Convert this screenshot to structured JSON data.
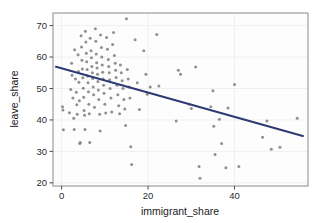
{
  "chart_data": {
    "type": "scatter",
    "title": "",
    "subtitle": "",
    "xlabel": "immigrant_share",
    "ylabel": "leave_share",
    "xlim": [
      -2,
      57
    ],
    "ylim": [
      19,
      74
    ],
    "xticks": [
      0,
      20,
      40
    ],
    "yticks": [
      20,
      30,
      40,
      50,
      60,
      70
    ],
    "xtick_labels": [
      "0",
      "20",
      "40"
    ],
    "ytick_labels": [
      "20",
      "30",
      "40",
      "50",
      "60",
      "70"
    ],
    "grid": true,
    "grid_axis": "both",
    "legend": "none",
    "point_color": "#7d7d7d",
    "point_opacity": 0.85,
    "point_size": 3.0,
    "fit_line_color": "#2f3a73",
    "fit_line_width": 2.0,
    "panel_background": "#fdfdfd",
    "panel_border_color": "#8a8a8a",
    "grid_color": "#f0f0f0",
    "series": [
      {
        "name": "fit_line",
        "type": "line",
        "x": [
          -1.5,
          56.0
        ],
        "y": [
          57.0,
          34.8
        ]
      }
    ],
    "points": [
      [
        0.2,
        44.2
      ],
      [
        0.3,
        43.2
      ],
      [
        0.4,
        36.9
      ],
      [
        1.8,
        42.3
      ],
      [
        2.1,
        49.7
      ],
      [
        2.3,
        58.0
      ],
      [
        2.4,
        54.2
      ],
      [
        2.6,
        47.0
      ],
      [
        2.8,
        40.5
      ],
      [
        2.9,
        37.0
      ],
      [
        3.0,
        62.3
      ],
      [
        3.2,
        53.0
      ],
      [
        3.4,
        48.8
      ],
      [
        3.5,
        44.8
      ],
      [
        3.6,
        41.8
      ],
      [
        3.8,
        60.7
      ],
      [
        3.9,
        55.4
      ],
      [
        4.0,
        52.0
      ],
      [
        4.1,
        46.1
      ],
      [
        4.2,
        32.5
      ],
      [
        4.3,
        32.8
      ],
      [
        4.5,
        66.8
      ],
      [
        4.6,
        63.2
      ],
      [
        4.7,
        59.0
      ],
      [
        4.8,
        56.2
      ],
      [
        4.9,
        53.4
      ],
      [
        5.0,
        50.1
      ],
      [
        5.1,
        47.2
      ],
      [
        5.2,
        43.0
      ],
      [
        5.3,
        41.5
      ],
      [
        5.4,
        37.0
      ],
      [
        5.5,
        68.2
      ],
      [
        5.6,
        64.8
      ],
      [
        5.7,
        61.2
      ],
      [
        5.8,
        58.5
      ],
      [
        5.9,
        56.0
      ],
      [
        6.0,
        54.0
      ],
      [
        6.1,
        51.8
      ],
      [
        6.2,
        49.0
      ],
      [
        6.3,
        45.0
      ],
      [
        6.4,
        42.0
      ],
      [
        6.5,
        32.8
      ],
      [
        6.6,
        66.0
      ],
      [
        6.8,
        62.0
      ],
      [
        6.9,
        59.8
      ],
      [
        7.0,
        57.0
      ],
      [
        7.1,
        55.0
      ],
      [
        7.2,
        53.2
      ],
      [
        7.3,
        50.5
      ],
      [
        7.4,
        48.0
      ],
      [
        7.6,
        44.0
      ],
      [
        7.8,
        69.0
      ],
      [
        7.9,
        65.0
      ],
      [
        8.0,
        61.0
      ],
      [
        8.1,
        58.2
      ],
      [
        8.2,
        56.5
      ],
      [
        8.3,
        54.5
      ],
      [
        8.4,
        52.2
      ],
      [
        8.5,
        49.5
      ],
      [
        8.6,
        46.5
      ],
      [
        8.8,
        41.8
      ],
      [
        8.9,
        36.5
      ],
      [
        9.0,
        67.0
      ],
      [
        9.2,
        63.0
      ],
      [
        9.3,
        60.0
      ],
      [
        9.4,
        57.5
      ],
      [
        9.5,
        55.2
      ],
      [
        9.6,
        53.0
      ],
      [
        9.7,
        51.0
      ],
      [
        9.8,
        48.5
      ],
      [
        10.0,
        45.0
      ],
      [
        10.2,
        42.2
      ],
      [
        10.4,
        66.2
      ],
      [
        10.6,
        62.5
      ],
      [
        10.8,
        59.2
      ],
      [
        10.9,
        57.0
      ],
      [
        11.0,
        55.0
      ],
      [
        11.1,
        52.8
      ],
      [
        11.2,
        50.0
      ],
      [
        11.4,
        47.0
      ],
      [
        11.6,
        42.5
      ],
      [
        11.8,
        64.0
      ],
      [
        12.0,
        67.8
      ],
      [
        12.2,
        60.5
      ],
      [
        12.4,
        58.0
      ],
      [
        12.5,
        55.8
      ],
      [
        12.6,
        53.5
      ],
      [
        12.8,
        51.0
      ],
      [
        13.0,
        48.0
      ],
      [
        13.2,
        44.5
      ],
      [
        13.4,
        42.0
      ],
      [
        13.6,
        57.5
      ],
      [
        13.8,
        55.0
      ],
      [
        14.0,
        52.5
      ],
      [
        14.2,
        50.0
      ],
      [
        14.4,
        46.5
      ],
      [
        14.6,
        43.5
      ],
      [
        14.8,
        38.2
      ],
      [
        15.0,
        72.2
      ],
      [
        15.2,
        56.0
      ],
      [
        15.4,
        53.0
      ],
      [
        15.6,
        50.5
      ],
      [
        15.8,
        47.0
      ],
      [
        16.0,
        31.5
      ],
      [
        16.2,
        25.8
      ],
      [
        17.0,
        65.5
      ],
      [
        17.5,
        51.8
      ],
      [
        18.0,
        43.3
      ],
      [
        19.0,
        62.0
      ],
      [
        19.5,
        54.5
      ],
      [
        19.8,
        48.2
      ],
      [
        20.5,
        50.5
      ],
      [
        22.0,
        67.2
      ],
      [
        22.5,
        50.8
      ],
      [
        26.5,
        39.7
      ],
      [
        27.0,
        55.8
      ],
      [
        27.5,
        54.5
      ],
      [
        29.5,
        45.0
      ],
      [
        30.0,
        43.6
      ],
      [
        31.0,
        56.8
      ],
      [
        31.8,
        25.2
      ],
      [
        32.0,
        21.5
      ],
      [
        34.5,
        44.2
      ],
      [
        35.0,
        49.3
      ],
      [
        35.2,
        38.0
      ],
      [
        35.5,
        29.0
      ],
      [
        36.5,
        40.2
      ],
      [
        37.0,
        32.5
      ],
      [
        38.0,
        24.8
      ],
      [
        38.5,
        43.8
      ],
      [
        40.0,
        51.3
      ],
      [
        41.0,
        25.2
      ],
      [
        46.5,
        34.5
      ],
      [
        47.5,
        39.7
      ],
      [
        48.5,
        30.7
      ],
      [
        50.5,
        31.3
      ],
      [
        54.5,
        40.5
      ]
    ]
  },
  "axes": {
    "x_title": "immigrant_share",
    "y_title": "leave_share"
  }
}
